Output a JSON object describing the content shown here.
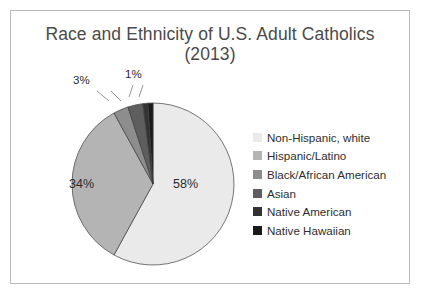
{
  "frame": {
    "border_color": "#b9b9b9",
    "background": "#ffffff"
  },
  "title": "Race and Ethnicity of U.S. Adult Catholics\n(2013)",
  "labels": {
    "p58": "58%",
    "p34": "34%",
    "p3": "3%",
    "p1": "1%"
  },
  "legend": {
    "items": [
      {
        "label": "Non-Hispanic, white",
        "color": "#eaeaea"
      },
      {
        "label": "Hispanic/Latino",
        "color": "#b4b4b4"
      },
      {
        "label": "Black/African American",
        "color": "#8d8d8d"
      },
      {
        "label": "Asian",
        "color": "#5e5e5e"
      },
      {
        "label": "Native American",
        "color": "#333333"
      },
      {
        "label": "Native Hawaiian",
        "color": "#1a1a1a"
      }
    ]
  },
  "chart_data": {
    "type": "pie",
    "title": "Race and Ethnicity of U.S. Adult Catholics (2013)",
    "subtitle": "(2013)",
    "categories": [
      "Non-Hispanic, white",
      "Hispanic/Latino",
      "Black/African American",
      "Asian",
      "Native American",
      "Native Hawaiian"
    ],
    "values": [
      58,
      34,
      3,
      3,
      1,
      1
    ],
    "value_unit": "percent",
    "data_labels": [
      "58%",
      "34%",
      "3%",
      "",
      "1%",
      ""
    ],
    "visible_data_labels": [
      "58%",
      "34%",
      "3%",
      "1%"
    ],
    "colors": [
      "#eaeaea",
      "#b4b4b4",
      "#8d8d8d",
      "#5e5e5e",
      "#333333",
      "#1a1a1a"
    ],
    "legend_position": "right",
    "grid": false,
    "start_angle_deg": 0,
    "direction": "clockwise",
    "xlabel": "",
    "ylabel": ""
  },
  "geometry": {
    "center_x": 142,
    "center_y": 173,
    "radius": 81
  }
}
